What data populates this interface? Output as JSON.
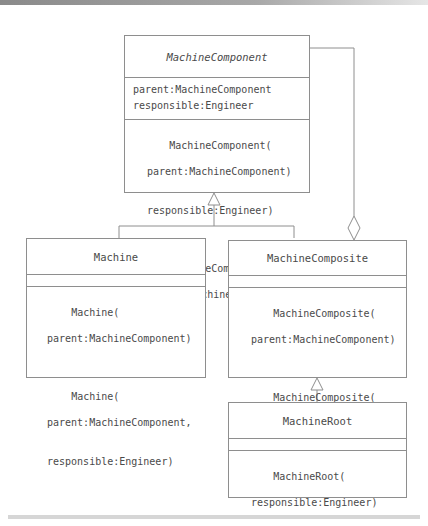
{
  "diagram": {
    "type": "uml-class-diagram",
    "classes": {
      "machine_component": {
        "name": "MachineComponent",
        "abstract": true,
        "attributes": [
          "parent:MachineComponent",
          "responsible:Engineer"
        ],
        "operations": [
          {
            "name": "MachineComponent(",
            "params": [
              "parent:MachineComponent)",
              "responsible:Engineer)"
            ]
          },
          {
            "name": "MachineComponent(",
            "params": [
              "parent:MachineComponent)"
            ]
          }
        ]
      },
      "machine": {
        "name": "Machine",
        "attributes": [],
        "operations": [
          {
            "name": "Machine(",
            "params": [
              "parent:MachineComponent)"
            ]
          },
          {
            "name": "Machine(",
            "params": [
              "parent:MachineComponent,",
              "responsible:Engineer)"
            ]
          }
        ]
      },
      "machine_composite": {
        "name": "MachineComposite",
        "attributes": [],
        "operations": [
          {
            "name": "MachineComposite(",
            "params": [
              "parent:MachineComponent)"
            ]
          },
          {
            "name": "MachineComposite(",
            "params": [
              "parent:MachineComponent,",
              "responsible:Engineer)"
            ]
          }
        ]
      },
      "machine_root": {
        "name": "MachineRoot",
        "attributes": [],
        "operations": [
          {
            "name": "MachineRoot(",
            "params": [
              "responsible:Engineer)"
            ]
          }
        ]
      }
    },
    "relationships": [
      {
        "type": "generalization",
        "from": "Machine",
        "to": "MachineComponent"
      },
      {
        "type": "generalization",
        "from": "MachineComposite",
        "to": "MachineComponent"
      },
      {
        "type": "generalization",
        "from": "MachineRoot",
        "to": "MachineComposite"
      },
      {
        "type": "aggregation",
        "whole": "MachineComposite",
        "part": "MachineComponent"
      }
    ],
    "colors": {
      "line": "#8e8e8e",
      "text": "#4a4a4a",
      "background": "#ffffff"
    }
  }
}
